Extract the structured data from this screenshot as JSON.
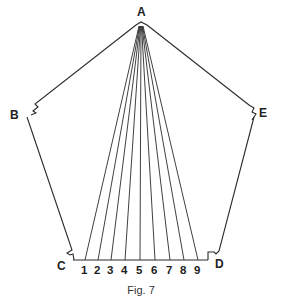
{
  "figure": {
    "caption": "Fig. 7",
    "vertices": [
      {
        "label": "A",
        "x": 141,
        "y": 20
      },
      {
        "label": "B",
        "x": 18,
        "y": 112
      },
      {
        "label": "C",
        "x": 63,
        "y": 264
      },
      {
        "label": "D",
        "x": 218,
        "y": 264
      },
      {
        "label": "E",
        "x": 264,
        "y": 112
      }
    ],
    "apex": {
      "x": 141,
      "y": 24
    },
    "baseline": {
      "y": 260,
      "x_start": 73,
      "x_end": 208
    },
    "divisions": [
      {
        "label": "1",
        "x": 85
      },
      {
        "label": "2",
        "x": 98
      },
      {
        "label": "3",
        "x": 111
      },
      {
        "label": "4",
        "x": 125
      },
      {
        "label": "5",
        "x": 140
      },
      {
        "label": "6",
        "x": 155
      },
      {
        "label": "7",
        "x": 170
      },
      {
        "label": "8",
        "x": 184
      },
      {
        "label": "9",
        "x": 198
      }
    ],
    "line_color": "#2a2a2a"
  }
}
